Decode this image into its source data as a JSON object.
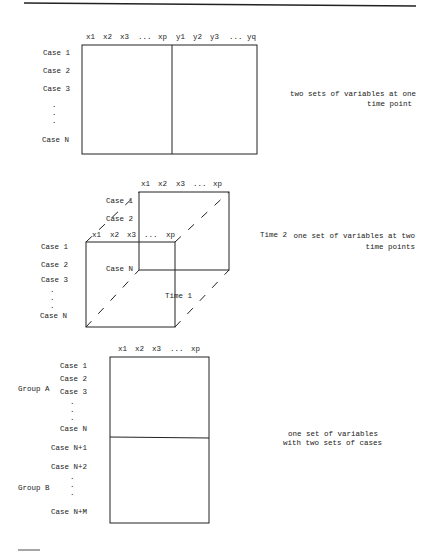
{
  "panel1": {
    "columns": [
      "x1",
      "x2",
      "x3",
      "...",
      "xp",
      "y1",
      "y2",
      "y3",
      "...",
      "yq"
    ],
    "rows": [
      "Case 1",
      "Case 2",
      "Case 3",
      ".",
      ".",
      ".",
      "Case N"
    ],
    "caption_line1": "two sets of variables at one",
    "caption_line2": "time point"
  },
  "panel2": {
    "back_columns": [
      "x1",
      "x2",
      "x3",
      "...",
      "xp"
    ],
    "back_rows": [
      "Case 1",
      "Case 2",
      "Case N"
    ],
    "front_columns": [
      "x1",
      "x2",
      "x3",
      "...",
      "xp"
    ],
    "front_rows": [
      "Case 1",
      "Case 2",
      "Case 3",
      ".",
      ".",
      ".",
      "Case N"
    ],
    "time2_label": "Time 2",
    "time1_label": "Time 1",
    "caption_line1": "one set of variables at two",
    "caption_line2": "time points"
  },
  "panel3": {
    "columns": [
      "x1",
      "x2",
      "x3",
      "...",
      "xp"
    ],
    "group_a_label": "Group A",
    "group_b_label": "Group B",
    "group_a_rows": [
      "Case 1",
      "Case 2",
      "Case 3",
      ".",
      ".",
      ".",
      "Case N"
    ],
    "group_b_rows": [
      "Case N+1",
      "Case N+2",
      ".",
      ".",
      ".",
      "Case N+M"
    ],
    "caption_line1": "one set of variables",
    "caption_line2": "with two sets of cases"
  }
}
